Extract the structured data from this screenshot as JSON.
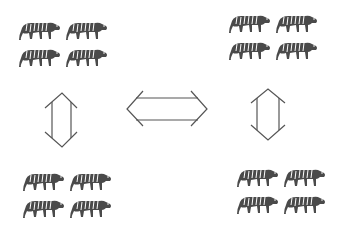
{
  "diagram": {
    "groups": [
      {
        "id": "top-left",
        "count": 4,
        "icon": "tiger-icon"
      },
      {
        "id": "top-right",
        "count": 4,
        "icon": "tiger-icon"
      },
      {
        "id": "bottom-left",
        "count": 4,
        "icon": "tiger-icon"
      },
      {
        "id": "bottom-right",
        "count": 4,
        "icon": "tiger-icon"
      }
    ],
    "arrows": [
      {
        "id": "left-vertical",
        "type": "double-headed",
        "orientation": "vertical",
        "connects": [
          "top-left",
          "bottom-left"
        ]
      },
      {
        "id": "center-horizontal",
        "type": "double-headed",
        "orientation": "horizontal",
        "connects": [
          "left",
          "right"
        ]
      },
      {
        "id": "right-vertical",
        "type": "double-headed",
        "orientation": "vertical",
        "connects": [
          "top-right",
          "bottom-right"
        ]
      }
    ],
    "colors": {
      "ink": "#2a2a2a",
      "background": "#ffffff"
    }
  }
}
